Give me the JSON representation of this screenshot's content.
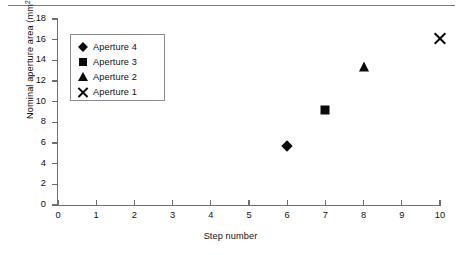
{
  "chart_data": {
    "type": "scatter",
    "title": "",
    "xlabel": "Step number",
    "ylabel": "Nominal aperture area (mm²)",
    "ylabel_text": "Nominal aperture area (mm",
    "ylabel_sup": "2",
    "ylabel_tail": ")",
    "xlim": [
      0,
      10
    ],
    "ylim": [
      0,
      18
    ],
    "xticks": [
      0,
      1,
      2,
      3,
      4,
      5,
      6,
      7,
      8,
      9,
      10
    ],
    "yticks": [
      0,
      2,
      4,
      6,
      8,
      10,
      12,
      14,
      16,
      18
    ],
    "grid": false,
    "legend_position": "upper-left-inside",
    "series": [
      {
        "name": "Aperture 4",
        "marker": "diamond",
        "color": "#0a0a0a",
        "x": [
          6
        ],
        "y": [
          5.7
        ]
      },
      {
        "name": "Aperture 3",
        "marker": "square",
        "color": "#0a0a0a",
        "x": [
          7
        ],
        "y": [
          9.2
        ]
      },
      {
        "name": "Aperture 2",
        "marker": "triangle",
        "color": "#0a0a0a",
        "x": [
          8
        ],
        "y": [
          13.4
        ]
      },
      {
        "name": "Aperture 1",
        "marker": "cross",
        "color": "#0a0a0a",
        "x": [
          10
        ],
        "y": [
          16.1
        ]
      }
    ]
  },
  "legend": {
    "entries": [
      {
        "label": "Aperture 4",
        "marker": "diamond"
      },
      {
        "label": "Aperture 3",
        "marker": "square"
      },
      {
        "label": "Aperture 2",
        "marker": "triangle"
      },
      {
        "label": "Aperture 1",
        "marker": "cross"
      }
    ]
  },
  "colors": {
    "axis": "#6f6f6f",
    "marker": "#0a0a0a",
    "text": "#111111",
    "legend_border": "#8a8a8a",
    "rule": "#7b7b7b",
    "background": "#ffffff"
  }
}
